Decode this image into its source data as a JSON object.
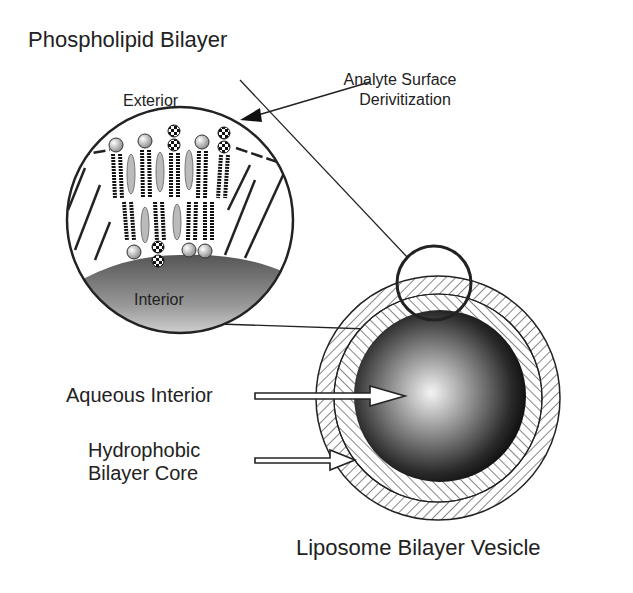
{
  "diagram": {
    "title_inset": "Phospholipid Bilayer",
    "inset_exterior": "Exterior",
    "inset_interior": "Interior",
    "label_analyte": [
      "Analyte Surface",
      "Derivitization"
    ],
    "label_aqueous": "Aqueous Interior",
    "label_hydrophobic": [
      "Hydrophobic",
      "Bilayer Core"
    ],
    "caption": "Liposome Bilayer Vesicle"
  },
  "colors": {
    "ink": "#222222",
    "background": "#ffffff",
    "core_dark": "#1a1a1a",
    "core_light": "#f2f2f2",
    "head_group": "#cfcfcf",
    "cholesterol": "#9a9a9a"
  }
}
